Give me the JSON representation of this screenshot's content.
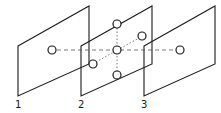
{
  "diagram": {
    "type": "parallel-planes-neighborhood",
    "planes": [
      {
        "label": "1",
        "offset_x": 0
      },
      {
        "label": "2",
        "offset_x": 63
      },
      {
        "label": "3",
        "offset_x": 126
      }
    ],
    "nodes": [
      {
        "id": "p1-center",
        "plane": "1",
        "cx": 52,
        "cy": 50
      },
      {
        "id": "p2-center",
        "plane": "2",
        "cx": 117,
        "cy": 50
      },
      {
        "id": "p2-top",
        "plane": "2",
        "cx": 117,
        "cy": 24
      },
      {
        "id": "p2-bottom",
        "plane": "2",
        "cx": 117,
        "cy": 75
      },
      {
        "id": "p2-back",
        "plane": "2",
        "cx": 142,
        "cy": 36
      },
      {
        "id": "p2-front",
        "plane": "2",
        "cx": 93,
        "cy": 64
      },
      {
        "id": "p3-center",
        "plane": "3",
        "cx": 180,
        "cy": 50
      }
    ],
    "colors": {
      "stroke": "#1a1a1a",
      "connector": "#555555",
      "background": "#ffffff"
    }
  }
}
